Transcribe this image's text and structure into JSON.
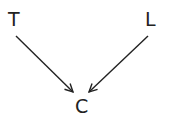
{
  "diagram": {
    "type": "directed-graph",
    "nodes": [
      {
        "id": "T",
        "label": "T"
      },
      {
        "id": "L",
        "label": "L"
      },
      {
        "id": "C",
        "label": "C"
      }
    ],
    "edges": [
      {
        "from": "T",
        "to": "C"
      },
      {
        "from": "L",
        "to": "C"
      }
    ],
    "colors": {
      "stroke": "#222222",
      "background": "#ffffff"
    }
  }
}
